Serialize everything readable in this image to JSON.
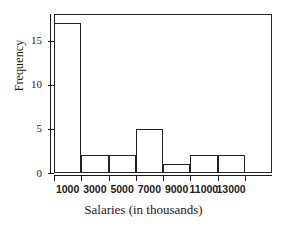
{
  "chart_data": {
    "type": "bar",
    "title": "",
    "xlabel": "Salaries (in thousands)",
    "ylabel": "Frequency",
    "categories": [
      "1000",
      "3000",
      "5000",
      "7000",
      "9000",
      "11000",
      "13000"
    ],
    "values": [
      17,
      2,
      2,
      5,
      1,
      2,
      2
    ],
    "bins": [
      {
        "label": "1000",
        "frequency": 17
      },
      {
        "label": "3000",
        "frequency": 2
      },
      {
        "label": "5000",
        "frequency": 2
      },
      {
        "label": "7000",
        "frequency": 5
      },
      {
        "label": "9000",
        "frequency": 1
      },
      {
        "label": "11000",
        "frequency": 2
      },
      {
        "label": "13000",
        "frequency": 2
      }
    ],
    "xlim": [
      0,
      14000
    ],
    "ylim": [
      0,
      18
    ],
    "bin_width": 2000,
    "x_ticks": [
      "1000",
      "3000",
      "5000",
      "7000",
      "9000",
      "11000",
      "13000"
    ],
    "y_ticks": [
      "0",
      "5",
      "10",
      "15"
    ],
    "y_tick_values": [
      0,
      5,
      10,
      15
    ],
    "grid": false,
    "legend": false,
    "bar_fill_color": "#ffffff",
    "bar_edge_color": "#222222",
    "axis_color": "#1a1a1a"
  },
  "axes": {
    "ylabel": "Frequency",
    "xlabel": "Salaries (in thousands)"
  }
}
